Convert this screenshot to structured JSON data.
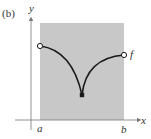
{
  "figure": {
    "panel_label": "(b)",
    "axis_labels": {
      "x": "x",
      "y": "y"
    },
    "interval_labels": {
      "left": "a",
      "right": "b"
    },
    "function_label": "f",
    "colors": {
      "shade": "#c8c8c8",
      "curve": "#1a1a1a",
      "axis": "#777777",
      "text": "#333333"
    },
    "points": {
      "left_endpoint": {
        "type": "open",
        "label": "a"
      },
      "minimum": {
        "type": "closed"
      },
      "right_endpoint": {
        "type": "open",
        "label": "b"
      }
    }
  }
}
